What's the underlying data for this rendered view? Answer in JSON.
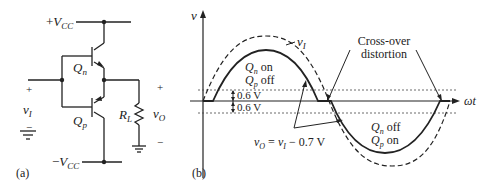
{
  "panel_a": {
    "label": "(a)",
    "vcc_pos": {
      "sign": "+",
      "v": "V",
      "sub": "CC"
    },
    "vcc_neg": {
      "sign": "−",
      "v": "V",
      "sub": "CC"
    },
    "qn": {
      "q": "Q",
      "sub": "n"
    },
    "qp": {
      "q": "Q",
      "sub": "p"
    },
    "rl": {
      "r": "R",
      "sub": "L"
    },
    "vi": {
      "v": "v",
      "sub": "I",
      "plus": "+",
      "minus": "−"
    },
    "vo": {
      "v": "v",
      "sub": "O",
      "plus": "+",
      "minus": "−"
    }
  },
  "panel_b": {
    "label": "(b)",
    "y_axis": "v",
    "x_axis": "ωt",
    "vi_label": {
      "v": "v",
      "sub": "I"
    },
    "crossover": [
      "Cross-over",
      "distortion"
    ],
    "pos_half": {
      "line1_q": "Q",
      "line1_sub": "n",
      "line1_txt": " on",
      "line2_q": "Q",
      "line2_sub": "p",
      "line2_txt": " off"
    },
    "neg_half": {
      "line1_q": "Q",
      "line1_sub": "n",
      "line1_txt": " off",
      "line2_q": "Q",
      "line2_sub": "p",
      "line2_txt": " on"
    },
    "thresh_up": "0.6 V",
    "thresh_down": "0.6 V",
    "equation": {
      "vo": "v",
      "vo_sub": "O",
      "eq": " = ",
      "vi": "v",
      "vi_sub": "I",
      "rest": " − 0.7 V"
    }
  }
}
